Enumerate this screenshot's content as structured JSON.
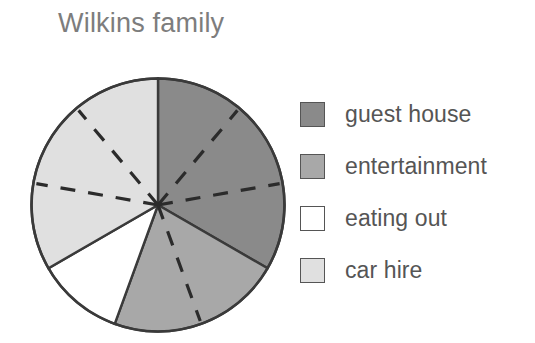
{
  "chart_data": {
    "type": "pie",
    "title": "Wilkins family",
    "xlabel": "",
    "ylabel": "",
    "legend_position": "right",
    "grid": false,
    "unit_angle_degrees": 40,
    "categories": [
      "guest house",
      "entertainment",
      "eating out",
      "car hire"
    ],
    "values": [
      3,
      2,
      1,
      3
    ],
    "angles_degrees": [
      120,
      80,
      40,
      120
    ],
    "percentages": [
      33.3,
      22.2,
      11.1,
      33.3
    ],
    "start_angle_degrees": 0,
    "direction": "clockwise",
    "slices": [
      {
        "label": "guest house",
        "value": 3,
        "angle_degrees": 120,
        "start_degrees": 0,
        "end_degrees": 120,
        "color": "#8a8a8a",
        "divider_count": 2
      },
      {
        "label": "entertainment",
        "value": 2,
        "angle_degrees": 80,
        "start_degrees": 120,
        "end_degrees": 200,
        "color": "#a8a8a8",
        "divider_count": 1
      },
      {
        "label": "eating out",
        "value": 1,
        "angle_degrees": 40,
        "start_degrees": 200,
        "end_degrees": 240,
        "color": "#ffffff",
        "divider_count": 0
      },
      {
        "label": "car hire",
        "value": 3,
        "angle_degrees": 120,
        "start_degrees": 240,
        "end_degrees": 360,
        "color": "#e0e0e0",
        "divider_count": 2
      }
    ]
  },
  "title": {
    "text": "Wilkins family",
    "color": "#7d7d7d"
  },
  "legend": {
    "items": [
      {
        "label": "guest house",
        "color": "#8a8a8a"
      },
      {
        "label": "entertainment",
        "color": "#a8a8a8"
      },
      {
        "label": "eating out",
        "color": "#ffffff"
      },
      {
        "label": "car hire",
        "color": "#e0e0e0"
      }
    ]
  },
  "colors": {
    "outline": "#3a3a3a",
    "divider_dash": "#2b2b2b",
    "text": "#555555",
    "background": "#ffffff"
  }
}
